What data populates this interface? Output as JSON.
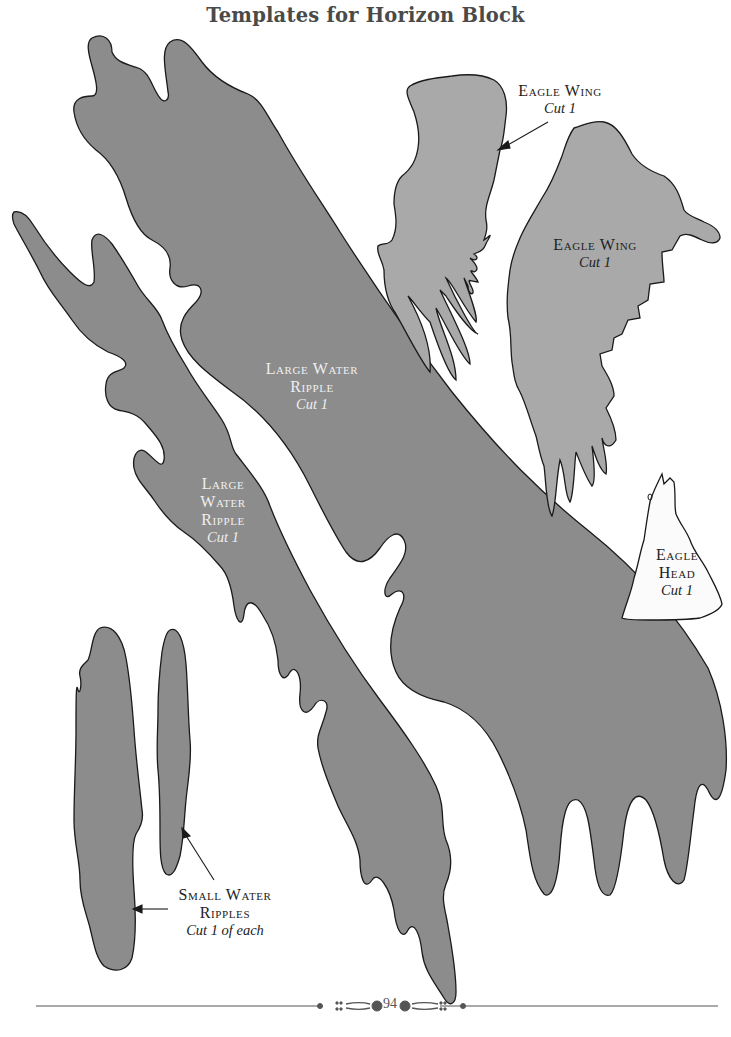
{
  "page": {
    "title": "Templates for Horizon Block",
    "page_number": "94"
  },
  "colors": {
    "water_fill": "#8c8c8c",
    "wing_fill": "#a9a9a9",
    "head_fill": "#fbfbfb",
    "outline": "#1a1a1a",
    "title_text": "#4a4a4a",
    "rule": "#555555"
  },
  "templates": {
    "eagle_wing_small": {
      "name": "Eagle Wing",
      "instruction": "Cut 1"
    },
    "eagle_wing_large": {
      "name": "Eagle Wing",
      "instruction": "Cut 1"
    },
    "eagle_head": {
      "name_line1": "Eagle",
      "name_line2": "Head",
      "instruction": "Cut 1"
    },
    "large_water_ripple_main": {
      "name_line1": "Large Water",
      "name_line2": "Ripple",
      "instruction": "Cut 1"
    },
    "large_water_ripple_left": {
      "name_line1": "Large",
      "name_line2": "Water",
      "name_line3": "Ripple",
      "instruction": "Cut 1"
    },
    "small_water_ripples": {
      "name_line1": "Small Water",
      "name_line2": "Ripples",
      "instruction": "Cut 1 of each"
    }
  }
}
